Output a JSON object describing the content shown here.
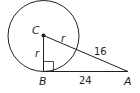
{
  "diagram": {
    "points": {
      "C": "C",
      "B": "B",
      "A": "A"
    },
    "segments": {
      "CB": "r",
      "CA_inside": "r",
      "CA_outside": "16",
      "BA": "24"
    },
    "right_angle_at": "B",
    "colors": {
      "stroke": "#231f20",
      "background": "#ffffff"
    }
  }
}
